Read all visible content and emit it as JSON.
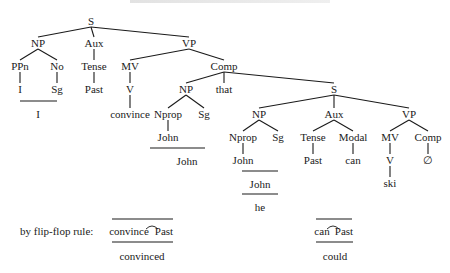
{
  "header": {
    "cropped_text": ""
  },
  "tree": {
    "root": "S",
    "level1": {
      "np": "NP",
      "aux": "Aux",
      "vp": "VP"
    },
    "subject": {
      "ppn": "PPn",
      "no": "No",
      "i": "I",
      "sg": "Sg",
      "merged": "I"
    },
    "aux": {
      "tense": "Tense",
      "past": "Past"
    },
    "vp": {
      "mv": "MV",
      "v": "V",
      "convince": "convince",
      "comp": "Comp"
    },
    "comp": {
      "np": "NP",
      "that": "that",
      "s": "S",
      "nprop": "Nprop",
      "sg": "Sg",
      "john": "John",
      "john_merged": "John"
    },
    "embedded": {
      "np": "NP",
      "aux": "Aux",
      "vp": "VP",
      "nprop": "Nprop",
      "sg": "Sg",
      "tense": "Tense",
      "modal": "Modal",
      "mv": "MV",
      "comp": "Comp",
      "john": "John",
      "past": "Past",
      "can": "can",
      "v": "V",
      "null": "∅",
      "ski": "ski",
      "john_merged": "John",
      "pronoun": "he"
    }
  },
  "flipflop": {
    "label": "by flip-flop rule:",
    "rule1": {
      "left": "convince",
      "right": "Past",
      "result": "convinced"
    },
    "rule2": {
      "left": "can",
      "right": "Past",
      "result": "could"
    }
  }
}
